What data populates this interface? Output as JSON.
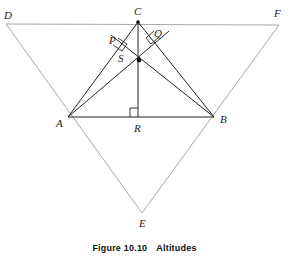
{
  "figure": {
    "caption_label": "Figure 10.10",
    "caption_title": "Altitudes",
    "colors": {
      "inner_stroke": "#222222",
      "outer_stroke": "#a8a8a8",
      "label_text": "#1a1a1a",
      "caption_text": "#111111",
      "background": "#ffffff"
    },
    "points": [
      {
        "id": "D",
        "label": "D",
        "x": 6,
        "y": 24,
        "label_x": 4,
        "label_y": 10
      },
      {
        "id": "C",
        "label": "C",
        "x": 138,
        "y": 22,
        "label_x": 134,
        "label_y": 7
      },
      {
        "id": "F",
        "label": "F",
        "x": 279,
        "y": 25,
        "label_x": 275,
        "label_y": 9
      },
      {
        "id": "P",
        "label": "P",
        "x": 123,
        "y": 46,
        "label_x": 110,
        "label_y": 36
      },
      {
        "id": "Q",
        "label": "Q",
        "x": 153,
        "y": 45,
        "label_x": 154,
        "label_y": 29
      },
      {
        "id": "S",
        "label": "S",
        "x": 139,
        "y": 60,
        "label_x": 118,
        "label_y": 54
      },
      {
        "id": "A",
        "label": "A",
        "x": 68,
        "y": 117,
        "label_x": 57,
        "label_y": 118
      },
      {
        "id": "R",
        "label": "R",
        "x": 138,
        "y": 117,
        "label_x": 134,
        "label_y": 123
      },
      {
        "id": "B",
        "label": "B",
        "x": 214,
        "y": 117,
        "label_x": 220,
        "label_y": 115
      },
      {
        "id": "E",
        "label": "E",
        "x": 142,
        "y": 213,
        "label_x": 139,
        "label_y": 219
      }
    ],
    "inner_triangle": {
      "name": "triangle-ABC",
      "vertices": [
        "A",
        "B",
        "C"
      ]
    },
    "outer_triangle": {
      "name": "triangle-DEF",
      "vertices": [
        "D",
        "E",
        "F"
      ]
    },
    "altitudes": [
      {
        "name": "altitude-C-to-R",
        "from": "C",
        "to": "R"
      },
      {
        "name": "altitude-A-to-Q",
        "from": "A",
        "to": "Q"
      },
      {
        "name": "altitude-B-to-P",
        "from": "B",
        "to": "P"
      }
    ],
    "right_angles": [
      {
        "name": "right-angle-at-P",
        "at": "P"
      },
      {
        "name": "right-angle-at-Q",
        "at": "Q"
      },
      {
        "name": "right-angle-at-R",
        "at": "R"
      }
    ],
    "orthocenter": {
      "name": "orthocenter-S",
      "point": "S"
    }
  }
}
